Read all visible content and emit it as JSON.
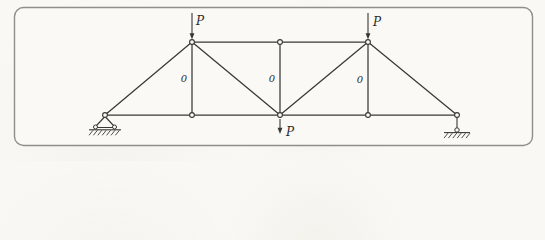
{
  "figure": {
    "type": "truss-diagram",
    "title": "",
    "colors": {
      "line": "#3a3835",
      "label": "#2e2c29",
      "frame_border": "#8f8e8b",
      "frame_fill": "#faf9f5",
      "joint_fill": "#fcfbf7"
    },
    "frame": {
      "x": 14.5,
      "y": 7.5,
      "width": 518,
      "height": 138,
      "radius": 9
    },
    "nodes": [
      {
        "id": "A",
        "x": 105,
        "y": 115
      },
      {
        "id": "B",
        "x": 192,
        "y": 115
      },
      {
        "id": "C",
        "x": 280,
        "y": 115
      },
      {
        "id": "D",
        "x": 368,
        "y": 115
      },
      {
        "id": "E",
        "x": 457,
        "y": 115
      },
      {
        "id": "F",
        "x": 192,
        "y": 42
      },
      {
        "id": "G",
        "x": 280,
        "y": 42
      },
      {
        "id": "H",
        "x": 368,
        "y": 42
      }
    ],
    "members": [
      {
        "from": "A",
        "to": "E",
        "name": "bottom-chord"
      },
      {
        "from": "F",
        "to": "H",
        "name": "top-chord"
      },
      {
        "from": "F",
        "to": "B",
        "name": "vertical-left"
      },
      {
        "from": "G",
        "to": "C",
        "name": "vertical-middle"
      },
      {
        "from": "H",
        "to": "D",
        "name": "vertical-right"
      },
      {
        "from": "A",
        "to": "F",
        "name": "diagonal-left-end"
      },
      {
        "from": "F",
        "to": "C",
        "name": "diagonal-left-inner"
      },
      {
        "from": "C",
        "to": "H",
        "name": "diagonal-right-inner"
      },
      {
        "from": "H",
        "to": "E",
        "name": "diagonal-right-end"
      }
    ],
    "loads": [
      {
        "label": "P",
        "x": 192,
        "tail_y": 13,
        "tip_y": 39.5,
        "label_x": 196,
        "label_y": 25
      },
      {
        "label": "P",
        "x": 368,
        "tail_y": 13,
        "tip_y": 39.5,
        "label_x": 373,
        "label_y": 26
      },
      {
        "label": "P",
        "x": 280,
        "tail_y": 119,
        "tip_y": 134,
        "label_x": 286,
        "label_y": 136
      }
    ],
    "member_force_labels": [
      {
        "text": "0",
        "x": 184,
        "y": 82
      },
      {
        "text": "0",
        "x": 272,
        "y": 82
      },
      {
        "text": "0",
        "x": 360,
        "y": 83
      }
    ],
    "supports": [
      {
        "type": "pin",
        "node": "A"
      },
      {
        "type": "roller-link",
        "node": "E"
      }
    ]
  }
}
